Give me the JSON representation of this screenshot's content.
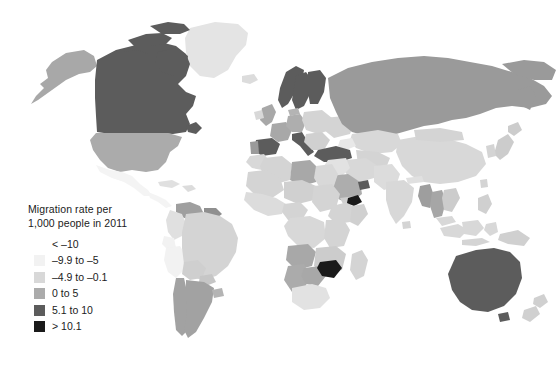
{
  "figure": {
    "type": "choropleth-world-map",
    "background_color": "#ffffff",
    "ocean_color": "#ffffff",
    "border_color": "#ffffff"
  },
  "legend": {
    "title": "Migration rate per\n1,000 people in 2011",
    "title_line_1": "Migration rate per",
    "title_line_2": "1,000 people in 2011",
    "items": [
      {
        "label": "< –10",
        "color": "#ffffff"
      },
      {
        "label": "–9.9 to –5",
        "color": "#f2f2f2"
      },
      {
        "label": "–4.9 to –0.1",
        "color": "#d8d8d8"
      },
      {
        "label": "0 to 5",
        "color": "#ababab"
      },
      {
        "label": "5.1 to 10",
        "color": "#5c5c5c"
      },
      {
        "label": "> 10.1",
        "color": "#1a1a1a"
      }
    ]
  },
  "chart_data": {
    "type": "heatmap",
    "title": "Migration rate per 1,000 people in 2011",
    "xlabel": "",
    "ylabel": "",
    "value_unit": "net migrants per 1,000 people",
    "year": 2011,
    "classes": [
      {
        "label": "< –10",
        "color": "#ffffff",
        "min": null,
        "max": -10
      },
      {
        "label": "–9.9 to –5",
        "color": "#f2f2f2",
        "min": -9.9,
        "max": -5
      },
      {
        "label": "–4.9 to –0.1",
        "color": "#d8d8d8",
        "min": -4.9,
        "max": -0.1
      },
      {
        "label": "0 to 5",
        "color": "#ababab",
        "min": 0,
        "max": 5
      },
      {
        "label": "5.1 to 10",
        "color": "#5c5c5c",
        "min": 5.1,
        "max": 10
      },
      {
        "label": "> 10.1",
        "color": "#1a1a1a",
        "min": 10.1,
        "max": null
      }
    ],
    "regions": [
      {
        "name": "Canada",
        "class": "5.1 to 10",
        "color": "#5c5c5c"
      },
      {
        "name": "United States",
        "class": "0 to 5",
        "color": "#ababab"
      },
      {
        "name": "Alaska",
        "class": "0 to 5",
        "color": "#ababab"
      },
      {
        "name": "Greenland",
        "class": "–4.9 to –0.1",
        "color": "#d8d8d8"
      },
      {
        "name": "Mexico",
        "class": "–9.9 to –5",
        "color": "#f2f2f2"
      },
      {
        "name": "Central America",
        "class": "–9.9 to –5",
        "color": "#f2f2f2"
      },
      {
        "name": "Caribbean",
        "class": "–4.9 to –0.1",
        "color": "#d8d8d8"
      },
      {
        "name": "Venezuela",
        "class": "0 to 5",
        "color": "#ababab"
      },
      {
        "name": "Colombia",
        "class": "–4.9 to –0.1",
        "color": "#d8d8d8"
      },
      {
        "name": "Ecuador",
        "class": "–9.9 to –5",
        "color": "#f2f2f2"
      },
      {
        "name": "Peru",
        "class": "–9.9 to –5",
        "color": "#f2f2f2"
      },
      {
        "name": "Brazil",
        "class": "–4.9 to –0.1",
        "color": "#d8d8d8"
      },
      {
        "name": "Bolivia",
        "class": "–4.9 to –0.1",
        "color": "#d8d8d8"
      },
      {
        "name": "Chile",
        "class": "0 to 5",
        "color": "#ababab"
      },
      {
        "name": "Argentina",
        "class": "0 to 5",
        "color": "#ababab"
      },
      {
        "name": "Norway",
        "class": "5.1 to 10",
        "color": "#5c5c5c"
      },
      {
        "name": "Sweden",
        "class": "5.1 to 10",
        "color": "#5c5c5c"
      },
      {
        "name": "Finland",
        "class": "5.1 to 10",
        "color": "#5c5c5c"
      },
      {
        "name": "United Kingdom",
        "class": "0 to 5",
        "color": "#ababab"
      },
      {
        "name": "Ireland",
        "class": "–4.9 to –0.1",
        "color": "#d8d8d8"
      },
      {
        "name": "Spain",
        "class": "5.1 to 10",
        "color": "#5c5c5c"
      },
      {
        "name": "Portugal",
        "class": "0 to 5",
        "color": "#ababab"
      },
      {
        "name": "France",
        "class": "0 to 5",
        "color": "#ababab"
      },
      {
        "name": "Germany",
        "class": "0 to 5",
        "color": "#ababab"
      },
      {
        "name": "Italy",
        "class": "5.1 to 10",
        "color": "#5c5c5c"
      },
      {
        "name": "Poland",
        "class": "–4.9 to –0.1",
        "color": "#d8d8d8"
      },
      {
        "name": "Eastern Europe",
        "class": "–4.9 to –0.1",
        "color": "#d8d8d8"
      },
      {
        "name": "Turkey",
        "class": "5.1 to 10",
        "color": "#5c5c5c"
      },
      {
        "name": "Russia",
        "class": "0 to 5",
        "color": "#9a9a9a"
      },
      {
        "name": "Kazakhstan",
        "class": "–4.9 to –0.1",
        "color": "#d8d8d8"
      },
      {
        "name": "Central Asia",
        "class": "–4.9 to –0.1",
        "color": "#d8d8d8"
      },
      {
        "name": "Iran",
        "class": "–4.9 to –0.1",
        "color": "#d8d8d8"
      },
      {
        "name": "Saudi Arabia",
        "class": "0 to 5",
        "color": "#ababab"
      },
      {
        "name": "Gulf States",
        "class": "5.1 to 10",
        "color": "#5c5c5c"
      },
      {
        "name": "Djibouti",
        "class": "> 10.1",
        "color": "#1a1a1a"
      },
      {
        "name": "Morocco",
        "class": "–4.9 to –0.1",
        "color": "#d8d8d8"
      },
      {
        "name": "Algeria",
        "class": "–4.9 to –0.1",
        "color": "#d8d8d8"
      },
      {
        "name": "Libya",
        "class": "0 to 5",
        "color": "#ababab"
      },
      {
        "name": "Egypt",
        "class": "–4.9 to –0.1",
        "color": "#d8d8d8"
      },
      {
        "name": "Sudan",
        "class": "–4.9 to –0.1",
        "color": "#d8d8d8"
      },
      {
        "name": "West Africa",
        "class": "–4.9 to –0.1",
        "color": "#d8d8d8"
      },
      {
        "name": "Nigeria",
        "class": "–4.9 to –0.1",
        "color": "#d8d8d8"
      },
      {
        "name": "Ethiopia",
        "class": "–4.9 to –0.1",
        "color": "#d8d8d8"
      },
      {
        "name": "Kenya",
        "class": "–4.9 to –0.1",
        "color": "#d8d8d8"
      },
      {
        "name": "DR Congo",
        "class": "–4.9 to –0.1",
        "color": "#d8d8d8"
      },
      {
        "name": "Angola",
        "class": "0 to 5",
        "color": "#ababab"
      },
      {
        "name": "Namibia",
        "class": "0 to 5",
        "color": "#ababab"
      },
      {
        "name": "Botswana",
        "class": "0 to 5",
        "color": "#ababab"
      },
      {
        "name": "Zimbabwe",
        "class": "> 10.1",
        "color": "#1a1a1a"
      },
      {
        "name": "South Africa",
        "class": "–4.9 to –0.1",
        "color": "#d8d8d8"
      },
      {
        "name": "Madagascar",
        "class": "–4.9 to –0.1",
        "color": "#d8d8d8"
      },
      {
        "name": "India",
        "class": "–4.9 to –0.1",
        "color": "#d8d8d8"
      },
      {
        "name": "Pakistan",
        "class": "–4.9 to –0.1",
        "color": "#d8d8d8"
      },
      {
        "name": "China",
        "class": "–4.9 to –0.1",
        "color": "#d8d8d8"
      },
      {
        "name": "Mongolia",
        "class": "–4.9 to –0.1",
        "color": "#d8d8d8"
      },
      {
        "name": "Myanmar",
        "class": "0 to 5",
        "color": "#ababab"
      },
      {
        "name": "Thailand",
        "class": "0 to 5",
        "color": "#ababab"
      },
      {
        "name": "Vietnam",
        "class": "–4.9 to –0.1",
        "color": "#d8d8d8"
      },
      {
        "name": "Indonesia",
        "class": "–4.9 to –0.1",
        "color": "#d8d8d8"
      },
      {
        "name": "Philippines",
        "class": "–4.9 to –0.1",
        "color": "#d8d8d8"
      },
      {
        "name": "Japan",
        "class": "–4.9 to –0.1",
        "color": "#d8d8d8"
      },
      {
        "name": "Korea",
        "class": "–4.9 to –0.1",
        "color": "#d8d8d8"
      },
      {
        "name": "Australia",
        "class": "5.1 to 10",
        "color": "#5c5c5c"
      },
      {
        "name": "New Zealand",
        "class": "–4.9 to –0.1",
        "color": "#d8d8d8"
      },
      {
        "name": "Papua New Guinea",
        "class": "–4.9 to –0.1",
        "color": "#d8d8d8"
      }
    ]
  }
}
